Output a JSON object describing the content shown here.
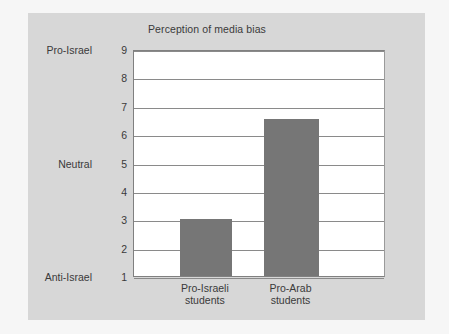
{
  "chart_data": {
    "type": "bar",
    "title": "Perception of media bias",
    "xlabel": "",
    "ylabel": "",
    "categories": [
      "Pro-Israeli students",
      "Pro-Arab students"
    ],
    "category_lines": [
      [
        "Pro-Israeli",
        "students"
      ],
      [
        "Pro-Arab",
        "students"
      ]
    ],
    "values": [
      3,
      6.55
    ],
    "ylim": [
      1,
      9
    ],
    "yticks": [
      1,
      2,
      3,
      4,
      5,
      6,
      7,
      8,
      9
    ],
    "ytick_labels": [
      "1",
      "2",
      "3",
      "4",
      "5",
      "6",
      "7",
      "8",
      "9"
    ],
    "y_named_ticks": [
      {
        "value": 9,
        "label": "Pro-Israel"
      },
      {
        "value": 5,
        "label": "Neutral"
      },
      {
        "value": 1,
        "label": "Anti-Israel"
      }
    ],
    "grid": true,
    "grid_axis": "y",
    "legend": false,
    "bar_color": "#767676",
    "plot_background": "#ffffff",
    "figure_background": "#d7d7d7",
    "page_background": "#f6f6f6",
    "gridline_color": "#8a8a8a",
    "text_color": "#3a3a3a"
  }
}
